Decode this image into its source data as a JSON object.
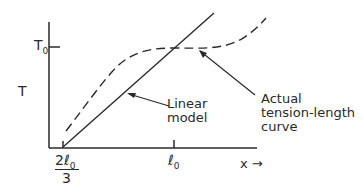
{
  "diagram": {
    "y_axis_label": "T",
    "y_tick_label": "T",
    "y_tick_sub": "0",
    "x_axis_label": "x",
    "x_arrow": "→",
    "x_tick_left_num": "2ℓ",
    "x_tick_left_sub": "0",
    "x_tick_left_den": "3",
    "x_tick_right": "ℓ",
    "x_tick_right_sub": "0",
    "annotations": {
      "linear_line1": "Linear",
      "linear_line2": "model",
      "actual_line1": "Actual",
      "actual_line2": "tension-length",
      "actual_line3": "curve"
    },
    "stroke_color": "#2a2a2a"
  }
}
